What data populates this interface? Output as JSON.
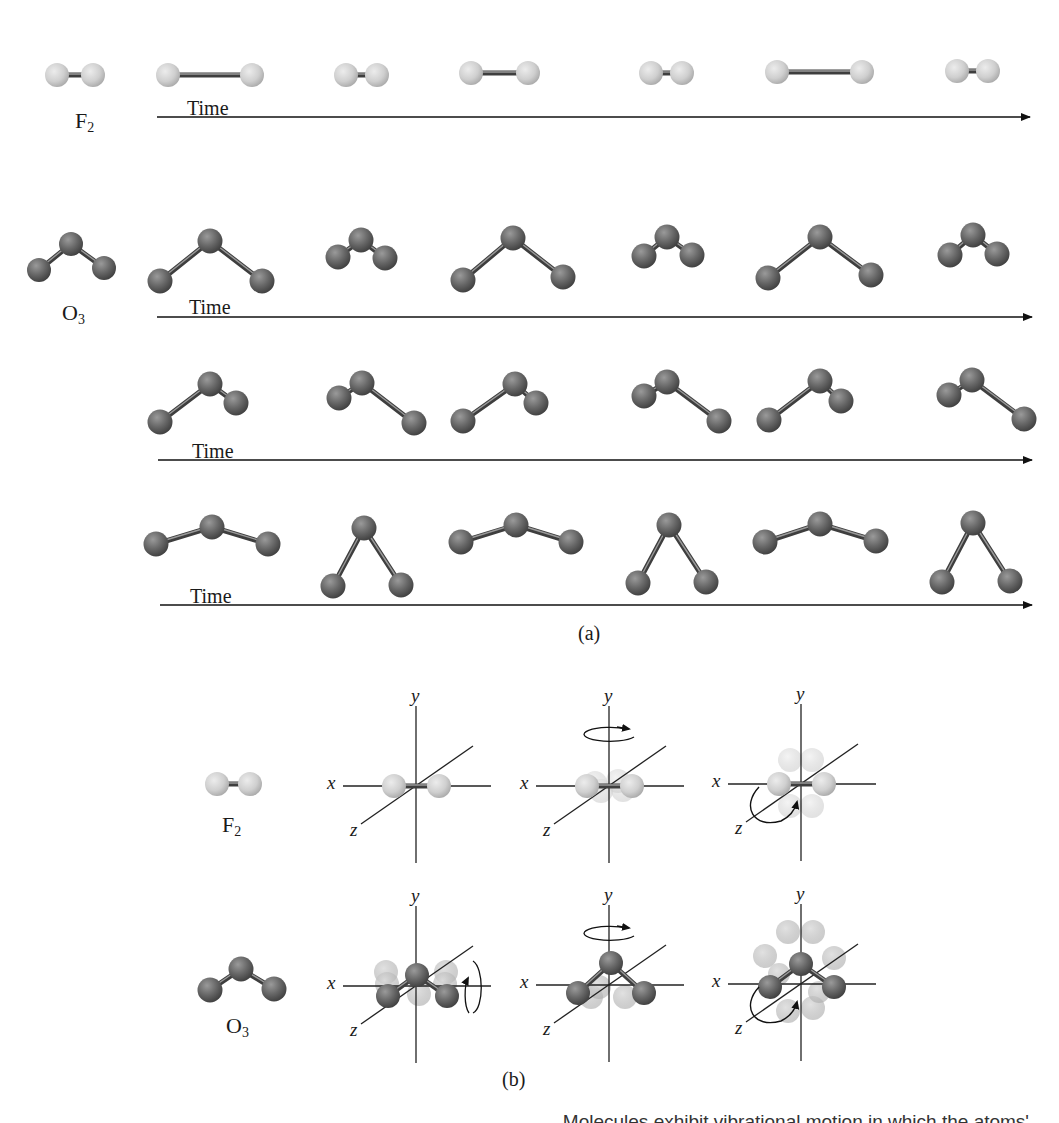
{
  "figure": {
    "panel_a_label": "(a)",
    "panel_b_label": "(b)",
    "cut_caption": "Molecules exhibit vibrational motion in which the atoms'"
  },
  "colors": {
    "fluorine_atom": "#d4d4d4",
    "fluorine_atom_shadow": "#9a9a9a",
    "oxygen_atom": "#6a6a6a",
    "oxygen_atom_shadow": "#3a3a3a",
    "bond": "#555555",
    "axis": "#222222",
    "ghost_atom": "#cfcfcf"
  },
  "panel_a": {
    "rows": [
      {
        "molecule": "F",
        "subscript": "2",
        "label_pos": [
          75,
          108
        ],
        "time_label": "Time",
        "time_label_pos": [
          187,
          97
        ],
        "timeline": {
          "x1": 157,
          "x2": 1030,
          "y": 117
        },
        "type": "diatomic",
        "reference": {
          "a": [
            57,
            75
          ],
          "b": [
            93,
            75
          ]
        },
        "frames": [
          {
            "a": [
              168,
              75
            ],
            "b": [
              252,
              75
            ]
          },
          {
            "a": [
              346,
              75
            ],
            "b": [
              377,
              75
            ]
          },
          {
            "a": [
              471,
              73
            ],
            "b": [
              528,
              73
            ]
          },
          {
            "a": [
              651,
              73
            ],
            "b": [
              682,
              73
            ]
          },
          {
            "a": [
              777,
              72
            ],
            "b": [
              862,
              72
            ]
          },
          {
            "a": [
              957,
              71
            ],
            "b": [
              988,
              71
            ]
          }
        ]
      },
      {
        "molecule": "O",
        "subscript": "3",
        "label_pos": [
          62,
          300
        ],
        "time_label": "Time",
        "time_label_pos": [
          189,
          296
        ],
        "timeline": {
          "x1": 157,
          "x2": 1032,
          "y": 317
        },
        "type": "triatomic",
        "reference": {
          "l": [
            39,
            270
          ],
          "c": [
            71,
            244
          ],
          "r": [
            104,
            268
          ]
        },
        "frames": [
          {
            "l": [
              160,
              281
            ],
            "c": [
              210,
              241
            ],
            "r": [
              262,
              281
            ]
          },
          {
            "l": [
              338,
              257
            ],
            "c": [
              361,
              240
            ],
            "r": [
              385,
              258
            ]
          },
          {
            "l": [
              463,
              280
            ],
            "c": [
              513,
              238
            ],
            "r": [
              563,
              277
            ]
          },
          {
            "l": [
              644,
              256
            ],
            "c": [
              667,
              237
            ],
            "r": [
              692,
              255
            ]
          },
          {
            "l": [
              768,
              278
            ],
            "c": [
              820,
              237
            ],
            "r": [
              871,
              275
            ]
          },
          {
            "l": [
              950,
              255
            ],
            "c": [
              973,
              235
            ],
            "r": [
              997,
              254
            ]
          }
        ]
      },
      {
        "molecule": "",
        "subscript": "",
        "time_label": "Time",
        "time_label_pos": [
          192,
          440
        ],
        "timeline": {
          "x1": 158,
          "x2": 1032,
          "y": 460
        },
        "type": "triatomic",
        "frames": [
          {
            "l": [
              160,
              422
            ],
            "c": [
              210,
              384
            ],
            "r": [
              236,
              403
            ]
          },
          {
            "l": [
              339,
              398
            ],
            "c": [
              362,
              383
            ],
            "r": [
              414,
              423
            ]
          },
          {
            "l": [
              463,
              421
            ],
            "c": [
              515,
              384
            ],
            "r": [
              536,
              403
            ]
          },
          {
            "l": [
              644,
              396
            ],
            "c": [
              667,
              382
            ],
            "r": [
              719,
              421
            ]
          },
          {
            "l": [
              769,
              420
            ],
            "c": [
              820,
              381
            ],
            "r": [
              841,
              401
            ]
          },
          {
            "l": [
              949,
              395
            ],
            "c": [
              972,
              380
            ],
            "r": [
              1024,
              419
            ]
          }
        ]
      },
      {
        "molecule": "",
        "subscript": "",
        "time_label": "Time",
        "time_label_pos": [
          190,
          585
        ],
        "timeline": {
          "x1": 160,
          "x2": 1032,
          "y": 605
        },
        "type": "triatomic",
        "frames": [
          {
            "l": [
              156,
              544
            ],
            "c": [
              212,
              527
            ],
            "r": [
              268,
              544
            ]
          },
          {
            "l": [
              333,
              586
            ],
            "c": [
              364,
              528
            ],
            "r": [
              401,
              585
            ]
          },
          {
            "l": [
              461,
              542
            ],
            "c": [
              516,
              525
            ],
            "r": [
              571,
              542
            ]
          },
          {
            "l": [
              638,
              583
            ],
            "c": [
              669,
              525
            ],
            "r": [
              706,
              582
            ]
          },
          {
            "l": [
              765,
              542
            ],
            "c": [
              820,
              524
            ],
            "r": [
              876,
              541
            ]
          },
          {
            "l": [
              942,
              582
            ],
            "c": [
              973,
              523
            ],
            "r": [
              1010,
              581
            ]
          }
        ]
      }
    ]
  },
  "panel_b": {
    "rows": [
      {
        "molecule": "F",
        "subscript": "2",
        "label_pos": [
          222,
          812
        ],
        "reference": {
          "a": [
            217,
            784
          ],
          "b": [
            250,
            784
          ]
        },
        "type": "diatomic",
        "axes": [
          {
            "cx": 416,
            "cy": 786,
            "rotation": "none"
          },
          {
            "cx": 609,
            "cy": 786,
            "rotation": "y"
          },
          {
            "cx": 801,
            "cy": 784,
            "rotation": "z"
          }
        ]
      },
      {
        "molecule": "O",
        "subscript": "3",
        "label_pos": [
          226,
          1013
        ],
        "reference": {
          "l": [
            210,
            990
          ],
          "c": [
            241,
            969
          ],
          "r": [
            274,
            989
          ]
        },
        "type": "triatomic",
        "axes": [
          {
            "cx": 416,
            "cy": 986,
            "rotation": "x"
          },
          {
            "cx": 609,
            "cy": 985,
            "rotation": "y"
          },
          {
            "cx": 801,
            "cy": 984,
            "rotation": "z"
          }
        ]
      }
    ],
    "axis_labels": {
      "x": "x",
      "y": "y",
      "z": "z"
    }
  }
}
